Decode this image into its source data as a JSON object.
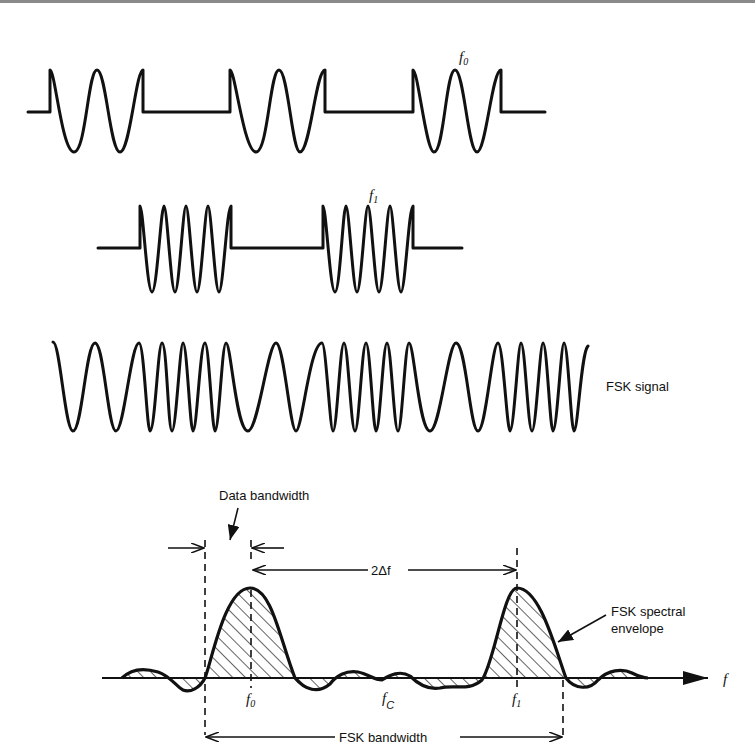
{
  "diagram": {
    "waveforms": [
      {
        "id": "f0-tone",
        "label": "f",
        "label_sub": "0",
        "cycles_per_burst": 2,
        "bursts": 3
      },
      {
        "id": "f1-tone",
        "label": "f",
        "label_sub": "1",
        "cycles_per_burst": 4,
        "bursts": 2
      },
      {
        "id": "fsk-signal",
        "label": "FSK signal"
      }
    ],
    "spectrum": {
      "axis_label": "f",
      "markers": {
        "f0": {
          "text": "f",
          "sub": "0"
        },
        "fc": {
          "text": "f",
          "sub": "C"
        },
        "f1": {
          "text": "f",
          "sub": "1"
        }
      },
      "annotations": {
        "data_bandwidth": "Data bandwidth",
        "two_delta_f": "2Δf",
        "envelope_line1": "FSK spectral",
        "envelope_line2": "envelope",
        "fsk_bandwidth": "FSK bandwidth"
      }
    }
  }
}
